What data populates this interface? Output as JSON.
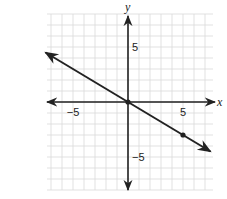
{
  "chart_data": {
    "type": "line",
    "title": "",
    "xlabel": "x",
    "ylabel": "y",
    "xlim": [
      -7.5,
      7.5
    ],
    "ylim": [
      -8,
      8
    ],
    "grid": true,
    "grid_step": 1,
    "tick_labels": {
      "x": [
        {
          "value": -5,
          "label": "−5"
        },
        {
          "value": 5,
          "label": "5"
        }
      ],
      "y": [
        {
          "value": 5,
          "label": "5"
        },
        {
          "value": -5,
          "label": "−5"
        }
      ]
    },
    "series": [
      {
        "name": "line",
        "equation": "y = -0.6x",
        "slope": -0.6,
        "intercept": 0,
        "x": [
          -7.5,
          7.5
        ],
        "y": [
          4.5,
          -4.5
        ],
        "arrows_both_ends": true
      }
    ],
    "points": [
      {
        "x": 0,
        "y": 0
      },
      {
        "x": 5,
        "y": -3
      }
    ]
  },
  "colors": {
    "grid": "#d9d9d9",
    "axis": "#222222",
    "line": "#222222"
  }
}
